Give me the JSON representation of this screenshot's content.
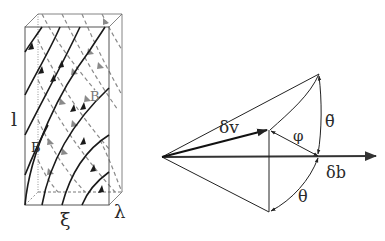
{
  "figure": {
    "left_panel": {
      "description": "Rectangular box with twisted magnetic field lines",
      "labels": {
        "height": "l",
        "width": "ξ",
        "depth": "λ",
        "field_front": "B",
        "field_back": "B"
      },
      "colors": {
        "front_lines": "#1a1a1a",
        "back_lines": "#8a8a8a",
        "box": "#555555"
      }
    },
    "right_panel": {
      "description": "Vector geometry showing δv relative to δb with angles",
      "labels": {
        "velocity": "δv",
        "field": "δb",
        "phi": "φ",
        "theta": "θ",
        "theta_tilde": "θ̃"
      },
      "colors": {
        "lines": "#222222",
        "axis": "#333333"
      }
    }
  }
}
